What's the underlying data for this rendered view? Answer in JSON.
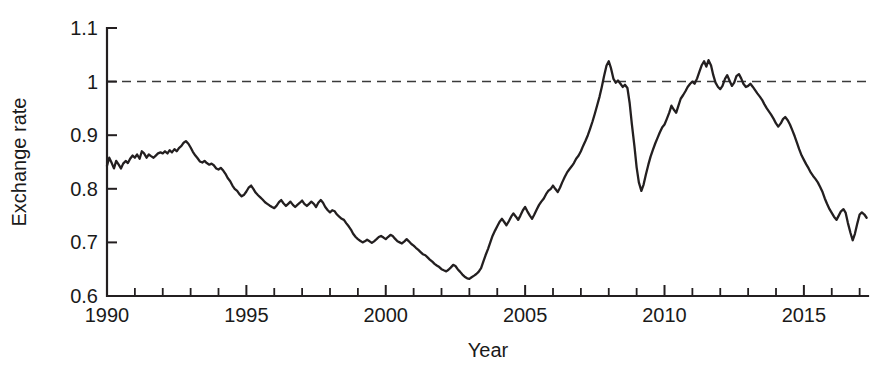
{
  "chart_data": {
    "type": "line",
    "title": "",
    "xlabel": "Year",
    "ylabel": "Exchange rate",
    "xlim": [
      1990,
      2017.3
    ],
    "ylim": [
      0.6,
      1.1
    ],
    "grid": false,
    "legend": null,
    "x_ticks_major": [
      1990,
      1995,
      2000,
      2005,
      2010,
      2015
    ],
    "x_tick_labels": [
      "1990",
      "1995",
      "2000",
      "2005",
      "2010",
      "2015"
    ],
    "x_ticks_minor_step": 1,
    "y_ticks": [
      0.6,
      0.7,
      0.8,
      0.9,
      1.0,
      1.1
    ],
    "y_tick_labels": [
      "0.6",
      "0.7",
      "0.8",
      "0.9",
      "1",
      "1.1"
    ],
    "reference_line": {
      "y": 1.0,
      "style": "dashed",
      "color": "#3a3a3a"
    },
    "line_color": "#231f20",
    "series": [
      {
        "name": "Exchange rate",
        "x": [
          1990.0,
          1990.08,
          1990.17,
          1990.25,
          1990.33,
          1990.42,
          1990.5,
          1990.58,
          1990.67,
          1990.75,
          1990.83,
          1990.92,
          1991.0,
          1991.08,
          1991.17,
          1991.25,
          1991.33,
          1991.42,
          1991.5,
          1991.58,
          1991.67,
          1991.75,
          1991.83,
          1991.92,
          1992.0,
          1992.08,
          1992.17,
          1992.25,
          1992.33,
          1992.42,
          1992.5,
          1992.58,
          1992.67,
          1992.75,
          1992.83,
          1992.92,
          1993.0,
          1993.08,
          1993.17,
          1993.25,
          1993.33,
          1993.42,
          1993.5,
          1993.58,
          1993.67,
          1993.75,
          1993.83,
          1993.92,
          1994.0,
          1994.08,
          1994.17,
          1994.25,
          1994.33,
          1994.42,
          1994.5,
          1994.58,
          1994.67,
          1994.75,
          1994.83,
          1994.92,
          1995.0,
          1995.08,
          1995.17,
          1995.25,
          1995.33,
          1995.42,
          1995.5,
          1995.58,
          1995.67,
          1995.75,
          1995.83,
          1995.92,
          1996.0,
          1996.08,
          1996.17,
          1996.25,
          1996.33,
          1996.42,
          1996.5,
          1996.58,
          1996.67,
          1996.75,
          1996.83,
          1996.92,
          1997.0,
          1997.08,
          1997.17,
          1997.25,
          1997.33,
          1997.42,
          1997.5,
          1997.58,
          1997.67,
          1997.75,
          1997.83,
          1997.92,
          1998.0,
          1998.08,
          1998.17,
          1998.25,
          1998.33,
          1998.42,
          1998.5,
          1998.58,
          1998.67,
          1998.75,
          1998.83,
          1998.92,
          1999.0,
          1999.08,
          1999.17,
          1999.25,
          1999.33,
          1999.42,
          1999.5,
          1999.58,
          1999.67,
          1999.75,
          1999.83,
          1999.92,
          2000.0,
          2000.08,
          2000.17,
          2000.25,
          2000.33,
          2000.42,
          2000.5,
          2000.58,
          2000.67,
          2000.75,
          2000.83,
          2000.92,
          2001.0,
          2001.08,
          2001.17,
          2001.25,
          2001.33,
          2001.42,
          2001.5,
          2001.58,
          2001.67,
          2001.75,
          2001.83,
          2001.92,
          2002.0,
          2002.08,
          2002.17,
          2002.25,
          2002.33,
          2002.42,
          2002.5,
          2002.58,
          2002.67,
          2002.75,
          2002.83,
          2002.92,
          2003.0,
          2003.08,
          2003.17,
          2003.25,
          2003.33,
          2003.42,
          2003.5,
          2003.58,
          2003.67,
          2003.75,
          2003.83,
          2003.92,
          2004.0,
          2004.08,
          2004.17,
          2004.25,
          2004.33,
          2004.42,
          2004.5,
          2004.58,
          2004.67,
          2004.75,
          2004.83,
          2004.92,
          2005.0,
          2005.08,
          2005.17,
          2005.25,
          2005.33,
          2005.42,
          2005.5,
          2005.58,
          2005.67,
          2005.75,
          2005.83,
          2005.92,
          2006.0,
          2006.08,
          2006.17,
          2006.25,
          2006.33,
          2006.42,
          2006.5,
          2006.58,
          2006.67,
          2006.75,
          2006.83,
          2006.92,
          2007.0,
          2007.08,
          2007.17,
          2007.25,
          2007.33,
          2007.42,
          2007.5,
          2007.58,
          2007.67,
          2007.75,
          2007.83,
          2007.92,
          2008.0,
          2008.08,
          2008.17,
          2008.25,
          2008.33,
          2008.42,
          2008.5,
          2008.58,
          2008.67,
          2008.75,
          2008.83,
          2008.92,
          2009.0,
          2009.08,
          2009.17,
          2009.25,
          2009.33,
          2009.42,
          2009.5,
          2009.58,
          2009.67,
          2009.75,
          2009.83,
          2009.92,
          2010.0,
          2010.08,
          2010.17,
          2010.25,
          2010.33,
          2010.42,
          2010.5,
          2010.58,
          2010.67,
          2010.75,
          2010.83,
          2010.92,
          2011.0,
          2011.08,
          2011.17,
          2011.25,
          2011.33,
          2011.42,
          2011.5,
          2011.58,
          2011.67,
          2011.75,
          2011.83,
          2011.92,
          2012.0,
          2012.08,
          2012.17,
          2012.25,
          2012.33,
          2012.42,
          2012.5,
          2012.58,
          2012.67,
          2012.75,
          2012.83,
          2012.92,
          2013.0,
          2013.08,
          2013.17,
          2013.25,
          2013.33,
          2013.42,
          2013.5,
          2013.58,
          2013.67,
          2013.75,
          2013.83,
          2013.92,
          2014.0,
          2014.08,
          2014.17,
          2014.25,
          2014.33,
          2014.42,
          2014.5,
          2014.58,
          2014.67,
          2014.75,
          2014.83,
          2014.92,
          2015.0,
          2015.08,
          2015.17,
          2015.25,
          2015.33,
          2015.42,
          2015.5,
          2015.58,
          2015.67,
          2015.75,
          2015.83,
          2015.92,
          2016.0,
          2016.08,
          2016.17,
          2016.25,
          2016.33,
          2016.42,
          2016.5,
          2016.58,
          2016.67,
          2016.75,
          2016.83,
          2016.92,
          2017.0,
          2017.08,
          2017.17,
          2017.25
        ],
        "values": [
          0.843,
          0.858,
          0.848,
          0.838,
          0.852,
          0.845,
          0.838,
          0.847,
          0.852,
          0.848,
          0.856,
          0.862,
          0.858,
          0.864,
          0.856,
          0.87,
          0.866,
          0.858,
          0.864,
          0.861,
          0.858,
          0.862,
          0.866,
          0.868,
          0.866,
          0.87,
          0.866,
          0.872,
          0.868,
          0.874,
          0.87,
          0.876,
          0.88,
          0.886,
          0.889,
          0.884,
          0.877,
          0.869,
          0.862,
          0.857,
          0.851,
          0.849,
          0.852,
          0.848,
          0.845,
          0.847,
          0.844,
          0.838,
          0.836,
          0.839,
          0.834,
          0.828,
          0.82,
          0.814,
          0.806,
          0.8,
          0.796,
          0.79,
          0.786,
          0.789,
          0.795,
          0.802,
          0.806,
          0.8,
          0.793,
          0.788,
          0.784,
          0.78,
          0.775,
          0.772,
          0.769,
          0.766,
          0.764,
          0.768,
          0.775,
          0.779,
          0.773,
          0.768,
          0.772,
          0.776,
          0.77,
          0.766,
          0.77,
          0.774,
          0.778,
          0.772,
          0.768,
          0.772,
          0.776,
          0.772,
          0.766,
          0.774,
          0.779,
          0.774,
          0.766,
          0.76,
          0.756,
          0.76,
          0.758,
          0.752,
          0.748,
          0.744,
          0.742,
          0.736,
          0.73,
          0.724,
          0.716,
          0.71,
          0.706,
          0.703,
          0.7,
          0.702,
          0.705,
          0.702,
          0.699,
          0.702,
          0.706,
          0.71,
          0.712,
          0.709,
          0.706,
          0.71,
          0.714,
          0.712,
          0.707,
          0.702,
          0.7,
          0.698,
          0.702,
          0.706,
          0.702,
          0.697,
          0.694,
          0.69,
          0.686,
          0.682,
          0.678,
          0.676,
          0.672,
          0.668,
          0.664,
          0.66,
          0.657,
          0.654,
          0.65,
          0.648,
          0.646,
          0.649,
          0.653,
          0.658,
          0.656,
          0.65,
          0.645,
          0.64,
          0.636,
          0.633,
          0.632,
          0.635,
          0.638,
          0.641,
          0.645,
          0.652,
          0.664,
          0.676,
          0.688,
          0.7,
          0.712,
          0.722,
          0.73,
          0.738,
          0.744,
          0.738,
          0.732,
          0.74,
          0.748,
          0.754,
          0.748,
          0.742,
          0.75,
          0.76,
          0.766,
          0.758,
          0.75,
          0.744,
          0.752,
          0.762,
          0.77,
          0.776,
          0.782,
          0.79,
          0.796,
          0.8,
          0.806,
          0.8,
          0.794,
          0.802,
          0.812,
          0.822,
          0.83,
          0.836,
          0.842,
          0.848,
          0.856,
          0.862,
          0.87,
          0.88,
          0.89,
          0.9,
          0.912,
          0.926,
          0.94,
          0.955,
          0.972,
          0.99,
          1.01,
          1.03,
          1.038,
          1.025,
          1.005,
          0.998,
          1.002,
          0.996,
          0.99,
          0.994,
          0.988,
          0.96,
          0.92,
          0.88,
          0.84,
          0.812,
          0.796,
          0.808,
          0.826,
          0.845,
          0.86,
          0.872,
          0.885,
          0.895,
          0.905,
          0.915,
          0.92,
          0.93,
          0.942,
          0.955,
          0.948,
          0.942,
          0.955,
          0.968,
          0.975,
          0.982,
          0.99,
          0.996,
          1.0,
          0.996,
          1.006,
          1.018,
          1.03,
          1.038,
          1.028,
          1.04,
          1.03,
          1.012,
          0.998,
          0.99,
          0.986,
          0.992,
          1.005,
          1.012,
          1.002,
          0.992,
          0.998,
          1.01,
          1.014,
          1.006,
          0.996,
          0.99,
          0.992,
          0.996,
          0.99,
          0.984,
          0.978,
          0.972,
          0.966,
          0.958,
          0.95,
          0.944,
          0.938,
          0.93,
          0.922,
          0.916,
          0.922,
          0.93,
          0.934,
          0.928,
          0.92,
          0.91,
          0.898,
          0.886,
          0.874,
          0.862,
          0.854,
          0.846,
          0.838,
          0.83,
          0.824,
          0.818,
          0.812,
          0.804,
          0.794,
          0.782,
          0.772,
          0.762,
          0.755,
          0.748,
          0.742,
          0.75,
          0.758,
          0.762,
          0.755,
          0.736,
          0.718,
          0.704,
          0.716,
          0.736,
          0.752,
          0.756,
          0.752,
          0.746
        ]
      }
    ],
    "annotations": [
      {
        "text": "dashed reference line at parity",
        "y": 1.0
      }
    ]
  },
  "axis": {
    "y_label": "Exchange rate",
    "x_label": "Year"
  }
}
